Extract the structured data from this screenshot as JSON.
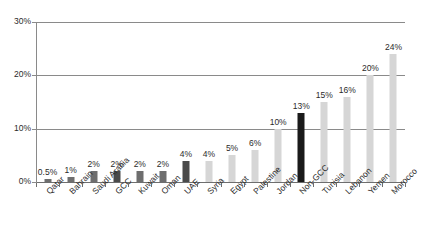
{
  "chart_data": {
    "type": "bar",
    "title": "",
    "subtitle": "",
    "xlabel": "",
    "ylabel": "",
    "ylim": [
      0,
      30
    ],
    "y_ticks": [
      0,
      10,
      20,
      30
    ],
    "y_tick_labels": [
      "0%",
      "10%",
      "20%",
      "30%"
    ],
    "grid": true,
    "legend": "none",
    "categories": [
      "Qatar",
      "Bahrain",
      "Saudi Arabia",
      "GCC",
      "Kuwait",
      "Oman",
      "UAE",
      "Syria",
      "Egypt",
      "Palestine",
      "Jordan",
      "Non-GCC",
      "Tunisia",
      "Lebanon",
      "Yemen",
      "Morocco"
    ],
    "values": [
      0.5,
      1,
      2,
      2,
      2,
      2,
      4,
      4,
      5,
      6,
      10,
      13,
      15,
      16,
      20,
      24
    ],
    "data_labels": [
      "0.5%",
      "1%",
      "2%",
      "2%",
      "2%",
      "2%",
      "4%",
      "4%",
      "5%",
      "6%",
      "10%",
      "13%",
      "15%",
      "16%",
      "20%",
      "24%"
    ],
    "bar_colors": [
      "#6e6e6e",
      "#6e6e6e",
      "#6e6e6e",
      "#4a4a4a",
      "#6e6e6e",
      "#6e6e6e",
      "#4a4a4a",
      "#d6d6d6",
      "#d6d6d6",
      "#d6d6d6",
      "#d6d6d6",
      "#1a1a1a",
      "#d6d6d6",
      "#d6d6d6",
      "#d6d6d6",
      "#d6d6d6"
    ]
  },
  "colors": {
    "gridline": "#8a8a8a",
    "axis": "#6e6e6e",
    "text": "#2b2b2b",
    "bar_dark": "#6e6e6e",
    "bar_darker": "#4a4a4a",
    "bar_black": "#1a1a1a",
    "bar_light": "#d6d6d6",
    "background": "#ffffff"
  }
}
